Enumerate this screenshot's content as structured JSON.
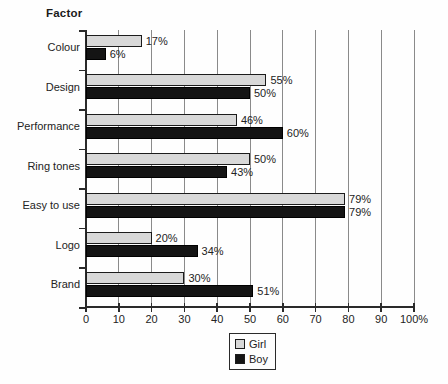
{
  "chart": {
    "factor_label": "Factor",
    "x_axis": {
      "ticks": [
        "0",
        "10",
        "20",
        "30",
        "40",
        "50",
        "60",
        "70",
        "80",
        "90",
        "100%"
      ],
      "min": 0,
      "max": 100
    },
    "legend": {
      "girl_label": "Girl",
      "boy_label": "Boy"
    },
    "colors": {
      "girl_bar": "#d8d8d8",
      "boy_bar": "#141414",
      "axis": "#2a2a2a",
      "gridline": "#8a8a8a",
      "background": "#fefefe"
    }
  },
  "chart_data": {
    "type": "bar",
    "orientation": "horizontal",
    "title": "Factor",
    "xlabel": "",
    "ylabel": "Factor",
    "xlim": [
      0,
      100
    ],
    "grid": "vertical",
    "legend_position": "bottom-center",
    "value_labels": "percent",
    "categories": [
      "Colour",
      "Design",
      "Performance",
      "Ring tones",
      "Easy to use",
      "Logo",
      "Brand"
    ],
    "series": [
      {
        "name": "Girl",
        "color": "#d8d8d8",
        "values": [
          17,
          55,
          46,
          50,
          79,
          20,
          30
        ]
      },
      {
        "name": "Boy",
        "color": "#141414",
        "values": [
          6,
          50,
          60,
          43,
          79,
          34,
          51
        ]
      }
    ]
  }
}
